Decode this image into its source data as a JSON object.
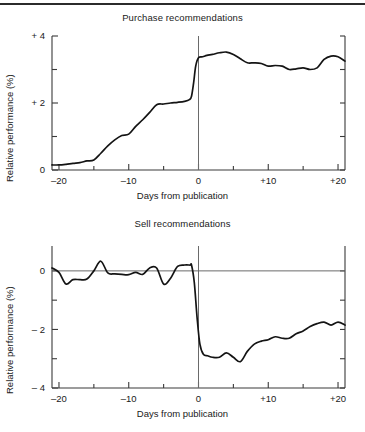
{
  "figure": {
    "has_top_rule": true,
    "background_color": "#ffffff",
    "line_color": "#141414"
  },
  "chart_data": [
    {
      "type": "line",
      "title": "Purchase recommendations",
      "xlabel": "Days from publication",
      "ylabel": "Relative performance (%)",
      "xlim": [
        -21,
        21
      ],
      "ylim": [
        0,
        4
      ],
      "xticks": [
        -20,
        -10,
        0,
        10,
        20
      ],
      "xticklabels": [
        "–20",
        "–10",
        "0",
        "+10",
        "+20"
      ],
      "xminorticks": [
        -15,
        -5,
        5,
        15
      ],
      "yticks": [
        0,
        2,
        4
      ],
      "yticklabels": [
        "0",
        "+ 2",
        "+ 4"
      ],
      "yminorticks": [
        1,
        3
      ],
      "grid": false,
      "legend": "none",
      "event_line_x": 0,
      "x": [
        -21,
        -20,
        -19,
        -18,
        -17,
        -16,
        -15,
        -14,
        -13,
        -12,
        -11,
        -10,
        -9,
        -8,
        -7,
        -6,
        -5,
        -4,
        -3,
        -2,
        -1.3,
        -1,
        -0.7,
        -0.4,
        0,
        0.6,
        1.2,
        2,
        3,
        4,
        5,
        6,
        7,
        8,
        9,
        10,
        11,
        12,
        13,
        14,
        15,
        16,
        17,
        18,
        19,
        20,
        21
      ],
      "y": [
        0.15,
        0.15,
        0.17,
        0.2,
        0.22,
        0.27,
        0.3,
        0.5,
        0.72,
        0.9,
        1.03,
        1.07,
        1.3,
        1.5,
        1.72,
        1.95,
        1.97,
        2.0,
        2.02,
        2.05,
        2.1,
        2.2,
        2.6,
        3.1,
        3.35,
        3.38,
        3.42,
        3.45,
        3.5,
        3.52,
        3.45,
        3.32,
        3.2,
        3.2,
        3.18,
        3.1,
        3.12,
        3.1,
        3.0,
        3.02,
        3.05,
        3.0,
        3.05,
        3.3,
        3.4,
        3.38,
        3.25
      ]
    },
    {
      "type": "line",
      "title": "Sell recommendations",
      "xlabel": "Days from publication",
      "ylabel": "Relative performance (%)",
      "xlim": [
        -21,
        21
      ],
      "ylim": [
        -4,
        0.85
      ],
      "xticks": [
        -20,
        -10,
        0,
        10,
        20
      ],
      "xticklabels": [
        "–20",
        "–10",
        "0",
        "+10",
        "+20"
      ],
      "xminorticks": [
        -15,
        -5,
        5,
        15
      ],
      "yticks": [
        0,
        -2,
        -4
      ],
      "yticklabels": [
        "0",
        "– 2",
        "– 4"
      ],
      "yminorticks": [
        -1,
        -3
      ],
      "grid": false,
      "legend": "none",
      "event_line_x": 0,
      "x": [
        -21,
        -20,
        -19,
        -18,
        -17,
        -16,
        -15,
        -14,
        -13,
        -12,
        -11,
        -10,
        -9,
        -8,
        -7,
        -6,
        -5,
        -4,
        -3,
        -2,
        -1.2,
        -1,
        -0.6,
        -0.2,
        0.2,
        0.7,
        1.3,
        2,
        3,
        4,
        5,
        6,
        7,
        8,
        9,
        10,
        11,
        12,
        13,
        14,
        15,
        16,
        17,
        18,
        19,
        20,
        21
      ],
      "y": [
        0.1,
        -0.05,
        -0.45,
        -0.3,
        -0.3,
        -0.28,
        0.0,
        0.33,
        -0.07,
        -0.1,
        -0.12,
        -0.13,
        -0.05,
        -0.12,
        0.1,
        0.1,
        -0.45,
        -0.25,
        0.15,
        0.2,
        0.2,
        0.2,
        -0.4,
        -1.6,
        -2.5,
        -2.85,
        -2.9,
        -2.95,
        -2.95,
        -2.8,
        -2.95,
        -3.1,
        -2.75,
        -2.5,
        -2.4,
        -2.35,
        -2.25,
        -2.3,
        -2.3,
        -2.15,
        -2.05,
        -1.9,
        -1.8,
        -1.75,
        -1.85,
        -1.75,
        -1.85
      ]
    }
  ]
}
